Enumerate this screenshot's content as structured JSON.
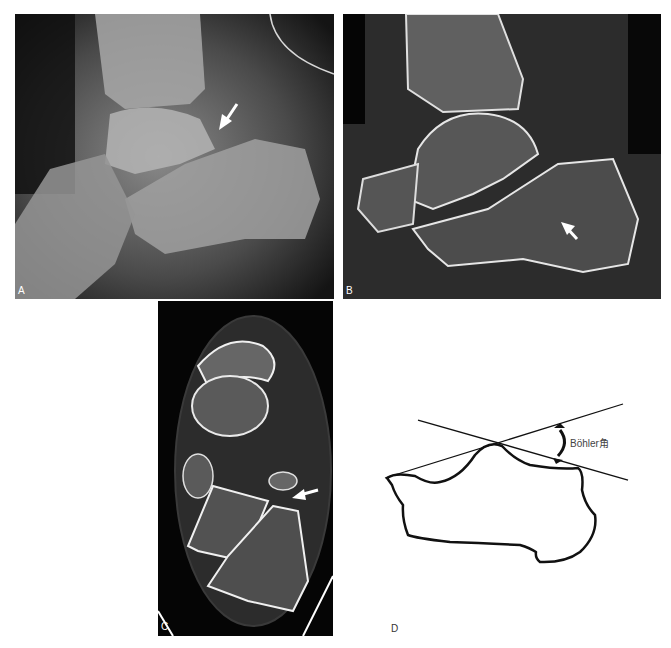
{
  "figure": {
    "panels": [
      {
        "id": "A",
        "label": "A",
        "kind": "lateral radiograph",
        "arrow": "white arrow pointing down-left"
      },
      {
        "id": "B",
        "label": "B",
        "kind": "sagittal CT",
        "arrow": "white arrow pointing down-right"
      },
      {
        "id": "C",
        "label": "C",
        "kind": "axial CT",
        "arrow": "white arrow pointing left"
      },
      {
        "id": "D",
        "label": "D",
        "kind": "line diagram",
        "annotation": "Böhler角"
      }
    ]
  }
}
